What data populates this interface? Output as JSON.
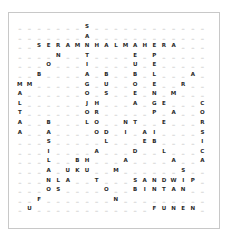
{
  "puzzle": {
    "blank_char": "_",
    "columns": 20,
    "rows": [
      "_______S____________",
      "_______A____________",
      "__SERAMNHALMAHERA___",
      "____N__T____E_P_____",
      "___O___I____U_E_____",
      "__B____A_B__B_L___A_",
      "MM_____G_U__O_E__R__",
      "A______O_S__E_N_M___",
      "L______JH___A_GE___C",
      "T______OR_____P_A__O",
      "A__B___LO__NT__E___R",
      "A__A____OD_I_AI____S",
      "___S_____L___EB____I",
      "___I____A___D__L___C",
      "___L__BH___A____A__A",
      "___A_UKU__M______S__",
      "___NLA__T___SANDWIP_",
      "___OS____O__BINTAN__",
      "__F_______N_________",
      "_U____________FUNEN_"
    ]
  }
}
